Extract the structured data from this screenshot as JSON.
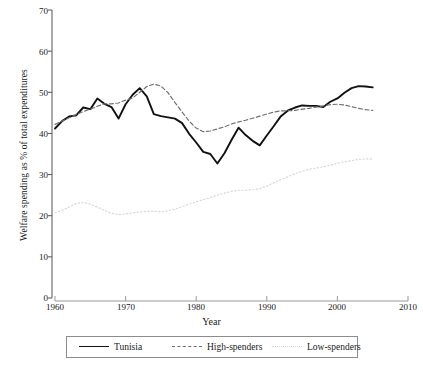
{
  "chart_data": {
    "type": "line",
    "title": "",
    "xlabel": "Year",
    "ylabel": "Welfare spending as % of total expenditures",
    "xlim": [
      1960,
      2010
    ],
    "ylim": [
      0,
      70
    ],
    "xticks": [
      1960,
      1970,
      1980,
      1990,
      2000,
      2010
    ],
    "yticks": [
      0,
      10,
      20,
      30,
      40,
      50,
      60,
      70
    ],
    "grid": false,
    "legend_position": "bottom",
    "series": [
      {
        "name": "Tunisia",
        "style": "solid",
        "color": "#111111",
        "x": [
          1960,
          1961,
          1962,
          1963,
          1964,
          1965,
          1966,
          1967,
          1968,
          1969,
          1970,
          1971,
          1972,
          1973,
          1974,
          1975,
          1976,
          1977,
          1978,
          1979,
          1980,
          1981,
          1982,
          1983,
          1984,
          1985,
          1986,
          1987,
          1988,
          1989,
          1990,
          1991,
          1992,
          1993,
          1994,
          1995,
          1996,
          1997,
          1998,
          1999,
          2000,
          2001,
          2002,
          2003,
          2004,
          2005
        ],
        "values": [
          41.2,
          43.0,
          44.1,
          44.4,
          46.3,
          45.9,
          48.5,
          47.2,
          46.4,
          43.6,
          47.1,
          49.4,
          51.0,
          49.0,
          44.7,
          44.2,
          43.9,
          43.6,
          42.5,
          39.9,
          37.8,
          35.5,
          35.0,
          32.7,
          35.2,
          38.4,
          41.4,
          39.6,
          38.2,
          37.1,
          39.5,
          41.8,
          44.2,
          45.6,
          46.3,
          46.8,
          46.7,
          46.7,
          46.4,
          47.7,
          48.5,
          49.9,
          51.0,
          51.5,
          51.4,
          51.2
        ]
      },
      {
        "name": "High-spenders",
        "style": "dashed",
        "color": "#6f6f6f",
        "x": [
          1960,
          1961,
          1962,
          1963,
          1964,
          1965,
          1966,
          1967,
          1968,
          1969,
          1970,
          1971,
          1972,
          1973,
          1974,
          1975,
          1976,
          1977,
          1978,
          1979,
          1980,
          1981,
          1982,
          1983,
          1984,
          1985,
          1986,
          1987,
          1988,
          1989,
          1990,
          1991,
          1992,
          1993,
          1994,
          1995,
          1996,
          1997,
          1998,
          1999,
          2000,
          2001,
          2002,
          2003,
          2004,
          2005
        ],
        "values": [
          42.2,
          43.0,
          43.8,
          44.6,
          45.3,
          45.9,
          46.6,
          47.2,
          47.2,
          47.4,
          48.1,
          48.6,
          50.0,
          51.4,
          52.0,
          51.5,
          49.9,
          47.5,
          45.2,
          43.0,
          41.3,
          40.4,
          40.6,
          41.1,
          41.6,
          42.3,
          42.8,
          43.2,
          43.7,
          44.2,
          44.7,
          45.2,
          45.5,
          45.5,
          45.6,
          45.9,
          46.1,
          46.4,
          46.7,
          47.0,
          47.1,
          46.9,
          46.5,
          46.1,
          45.8,
          45.6
        ]
      },
      {
        "name": "Low-spenders",
        "style": "dotted",
        "color": "#d8d8d8",
        "x": [
          1960,
          1961,
          1962,
          1963,
          1964,
          1965,
          1966,
          1967,
          1968,
          1969,
          1970,
          1971,
          1972,
          1973,
          1974,
          1975,
          1976,
          1977,
          1978,
          1979,
          1980,
          1981,
          1982,
          1983,
          1984,
          1985,
          1986,
          1987,
          1988,
          1989,
          1990,
          1991,
          1992,
          1993,
          1994,
          1995,
          1996,
          1997,
          1998,
          1999,
          2000,
          2001,
          2002,
          2003,
          2004,
          2005
        ],
        "values": [
          20.7,
          21.3,
          22.1,
          22.9,
          23.2,
          22.8,
          22.1,
          21.3,
          20.6,
          20.3,
          20.4,
          20.7,
          20.9,
          21.1,
          21.1,
          20.9,
          21.2,
          21.6,
          22.2,
          22.8,
          23.4,
          23.9,
          24.4,
          25.0,
          25.5,
          25.9,
          26.2,
          26.2,
          26.3,
          26.6,
          27.2,
          28.0,
          28.8,
          29.5,
          30.2,
          30.8,
          31.3,
          31.6,
          31.9,
          32.3,
          32.7,
          33.1,
          33.4,
          33.7,
          33.8,
          33.8
        ]
      }
    ]
  },
  "axes": {
    "xtick_labels": [
      "1960",
      "1970",
      "1980",
      "1990",
      "2000",
      "2010"
    ],
    "ytick_labels": [
      "0",
      "10",
      "20",
      "30",
      "40",
      "50",
      "60",
      "70"
    ],
    "xlabel": "Year",
    "ylabel": "Welfare spending as % of total expenditures"
  },
  "legend": {
    "entries": [
      {
        "label": "Tunisia",
        "style": "solid"
      },
      {
        "label": "High-spenders",
        "style": "dashed"
      },
      {
        "label": "Low-spenders",
        "style": "dotted"
      }
    ]
  }
}
